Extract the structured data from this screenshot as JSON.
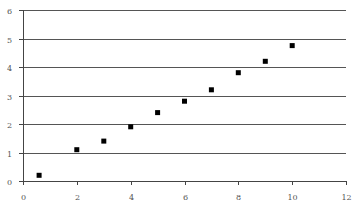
{
  "chart_data": {
    "type": "scatter",
    "title": "",
    "xlabel": "",
    "ylabel": "",
    "xlim": [
      0,
      12
    ],
    "ylim": [
      0,
      6
    ],
    "x_ticks": [
      0,
      2,
      4,
      6,
      8,
      10,
      12
    ],
    "y_ticks": [
      0,
      1,
      2,
      3,
      4,
      5,
      6
    ],
    "x_tick_labels": [
      "0",
      "2",
      "4",
      "6",
      "8",
      "10",
      "12"
    ],
    "y_tick_labels": [
      "0",
      "1",
      "2",
      "3",
      "4",
      "5",
      "6"
    ],
    "grid": {
      "horizontal": true,
      "vertical": false
    },
    "legend": null,
    "series": [
      {
        "name": "",
        "marker": "square",
        "color": "#000000",
        "x": [
          0.6,
          2,
          3,
          4,
          5,
          6,
          7,
          8,
          9,
          10
        ],
        "y": [
          0.2,
          1.1,
          1.4,
          1.9,
          2.4,
          2.8,
          3.2,
          3.8,
          4.2,
          4.75
        ]
      }
    ]
  },
  "style": {
    "grid_color": "#555555",
    "axis_color": "#444444",
    "marker_color": "#000000"
  }
}
